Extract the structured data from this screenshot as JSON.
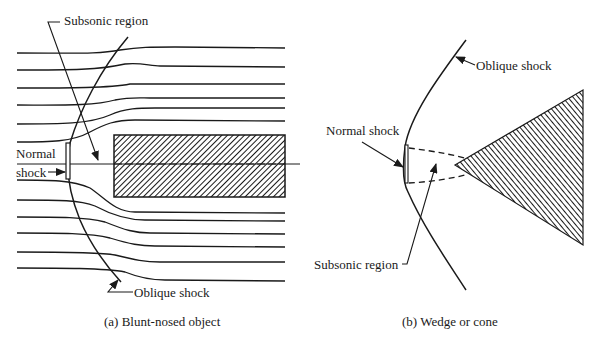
{
  "figure": {
    "panel_a": {
      "caption": "(a) Blunt-nosed object",
      "labels": {
        "subsonic_region": "Subsonic region",
        "normal_shock_line1": "Normal",
        "normal_shock_line2": "shock",
        "oblique_shock": "Oblique shock"
      }
    },
    "panel_b": {
      "caption": "(b) Wedge or cone",
      "labels": {
        "oblique_shock": "Oblique shock",
        "normal_shock": "Normal shock",
        "subsonic_region": "Subsonic region"
      }
    },
    "colors": {
      "ink": "#1a1a1a",
      "background": "#ffffff"
    }
  }
}
